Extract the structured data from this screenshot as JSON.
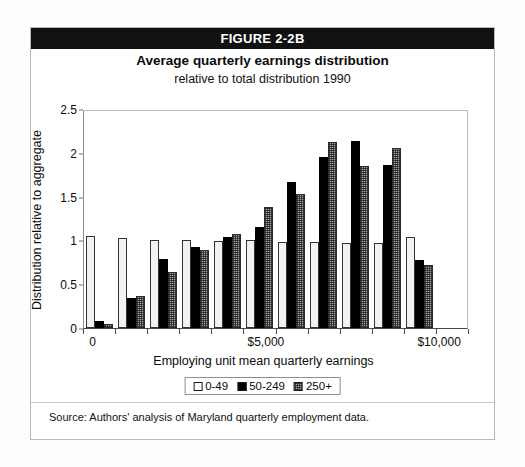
{
  "figure": {
    "header_label": "FIGURE 2-2B",
    "title": "Average quarterly earnings distribution",
    "subtitle": "relative to total distribution 1990",
    "source_note": "Source: Authors' analysis of Maryland quarterly employment data."
  },
  "colors": {
    "header_bg": "#111111",
    "header_text": "#ffffff",
    "series_0_49": "#f2f2f2",
    "series_50_249": "#000000",
    "series_250_plus": "#9e9e9e",
    "frame": "#b9b9b9",
    "axis": "#4a4a4a"
  },
  "chart_data": {
    "type": "bar",
    "title": "Average quarterly earnings distribution",
    "subtitle": "relative to total distribution 1990",
    "xlabel": "Employing unit mean quarterly earnings",
    "ylabel": "Distribution relative to aggregate",
    "ylim": [
      0,
      2.5
    ],
    "yticks": [
      0,
      0.5,
      1,
      1.5,
      2,
      2.5
    ],
    "ytick_labels": [
      "0",
      "0.5",
      "1",
      "1.5",
      "2",
      "2.5"
    ],
    "xtick_labels": [
      "0",
      "$5,000",
      "$10,000"
    ],
    "xtick_positions": [
      0,
      5,
      10
    ],
    "grid": false,
    "legend_position": "bottom",
    "categories": [
      "1",
      "2",
      "3",
      "4",
      "5",
      "6",
      "7",
      "8",
      "9",
      "10",
      "11",
      "12"
    ],
    "series": [
      {
        "name": "0-49",
        "values": [
          1.05,
          1.03,
          1.0,
          1.0,
          0.99,
          1.0,
          0.98,
          0.98,
          0.97,
          0.97,
          0.97,
          1.04
        ]
      },
      {
        "name": "50-249",
        "values": [
          0.08,
          0.34,
          0.79,
          0.92,
          1.04,
          1.15,
          1.67,
          1.95,
          2.13,
          1.86,
          0.78,
          0.0
        ]
      },
      {
        "name": "250+",
        "values": [
          0.05,
          0.36,
          0.64,
          0.89,
          1.07,
          1.38,
          1.53,
          2.12,
          1.85,
          2.05,
          0.72,
          0.0
        ]
      }
    ],
    "legend_entries": [
      "0-49",
      "50-249",
      "250+"
    ],
    "note": "Twelve earnings bins across $0-$10,000+; bars 11 and 12 shown in plot order"
  },
  "bar_groups": [
    {
      "values": [
        1.05,
        0.08,
        0.05
      ]
    },
    {
      "values": [
        1.03,
        0.34,
        0.36
      ]
    },
    {
      "values": [
        1.0,
        0.79,
        0.64
      ]
    },
    {
      "values": [
        1.0,
        0.92,
        0.89
      ]
    },
    {
      "values": [
        0.99,
        1.04,
        1.07
      ]
    },
    {
      "values": [
        1.0,
        1.15,
        1.38
      ]
    },
    {
      "values": [
        0.98,
        1.67,
        1.53
      ]
    },
    {
      "values": [
        0.98,
        1.95,
        2.12
      ]
    },
    {
      "values": [
        0.97,
        2.13,
        1.85
      ]
    },
    {
      "values": [
        0.97,
        1.86,
        2.05
      ]
    },
    {
      "values": [
        1.04,
        0.78,
        0.72
      ]
    }
  ],
  "axis": {
    "y_ticks": [
      {
        "label": "2.5",
        "value": 2.5
      },
      {
        "label": "2",
        "value": 2
      },
      {
        "label": "1.5",
        "value": 1.5
      },
      {
        "label": "1",
        "value": 1
      },
      {
        "label": "0.5",
        "value": 0.5
      },
      {
        "label": "0",
        "value": 0
      }
    ],
    "x_labels": [
      {
        "label": "0",
        "pos_pct": 2.5
      },
      {
        "label": "$5,000",
        "pos_pct": 47.5
      },
      {
        "label": "$10,000",
        "pos_pct": 92.5
      }
    ],
    "x_title": "Employing unit mean quarterly earnings",
    "y_title": "Distribution relative to aggregate"
  },
  "legend": {
    "items": [
      {
        "label": "0-49",
        "swatch": "white-square"
      },
      {
        "label": "50-249",
        "swatch": "black-square"
      },
      {
        "label": "250+",
        "swatch": "hatched-square"
      }
    ]
  }
}
